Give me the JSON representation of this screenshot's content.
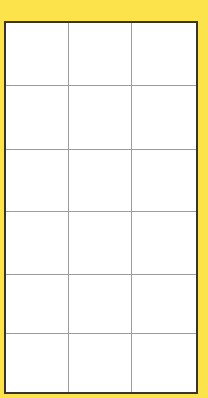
{
  "colors": {
    "background": "#FDE34B",
    "grid_border": "#3a3328",
    "grid_lines": "#9c9c9c",
    "cell_fill": "#ffffff"
  },
  "grid": {
    "rows": 6,
    "cols": 3,
    "col_widths": [
      63,
      63,
      64
    ],
    "row_heights": [
      63,
      64,
      62,
      63,
      59,
      58
    ],
    "cells": [
      [
        "",
        "",
        ""
      ],
      [
        "",
        "",
        ""
      ],
      [
        "",
        "",
        ""
      ],
      [
        "",
        "",
        ""
      ],
      [
        "",
        "",
        ""
      ],
      [
        "",
        "",
        ""
      ]
    ]
  }
}
